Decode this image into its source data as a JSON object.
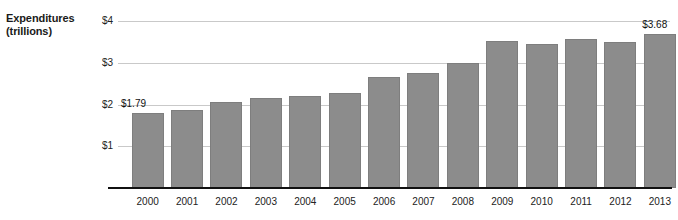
{
  "axis_title": {
    "line1": "Expenditures",
    "line2": "(trillions)"
  },
  "chart_data": {
    "type": "bar",
    "title": "",
    "subtitle": "",
    "xlabel": "",
    "ylabel": "Expenditures (trillions)",
    "categories": [
      "2000",
      "2001",
      "2002",
      "2003",
      "2004",
      "2005",
      "2006",
      "2007",
      "2008",
      "2009",
      "2010",
      "2011",
      "2012",
      "2013"
    ],
    "values": [
      1.79,
      1.86,
      2.07,
      2.16,
      2.21,
      2.27,
      2.65,
      2.76,
      2.99,
      3.52,
      3.46,
      3.58,
      3.5,
      3.68
    ],
    "ylim": [
      0,
      4
    ],
    "ytick_values": [
      1,
      2,
      3,
      4
    ],
    "ytick_labels": [
      "$1",
      "$2",
      "$3",
      "$4"
    ],
    "grid": true,
    "legend": "none",
    "bar_color": "#8c8c8c",
    "gridline_color": "#c9c9c9",
    "axis_color": "#111111",
    "annotations": [
      {
        "category": "2000",
        "text": "$1.79"
      },
      {
        "category": "2013",
        "text": "$3.68"
      }
    ]
  }
}
